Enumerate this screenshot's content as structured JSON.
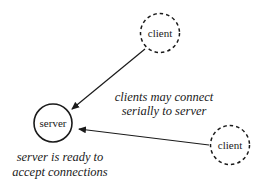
{
  "diagram": {
    "nodes": {
      "server": {
        "label": "server",
        "style": "solid",
        "cx": 53,
        "cy": 123,
        "r": 19
      },
      "client_top": {
        "label": "client",
        "style": "dashed",
        "cx": 160,
        "cy": 33,
        "r": 19.5
      },
      "client_right": {
        "label": "client",
        "style": "dashed",
        "cx": 230,
        "cy": 145,
        "r": 19.5
      }
    },
    "edges": [
      {
        "from": "client_top",
        "to": "server",
        "label": ""
      },
      {
        "from": "client_right",
        "to": "server",
        "label": ""
      }
    ],
    "annotations": {
      "clients_connect": {
        "line1": "clients may connect",
        "line2": "serially to server"
      },
      "server_ready": {
        "line1": "server is ready to",
        "line2": "accept connections"
      }
    },
    "colors": {
      "stroke": "#1a1a1a",
      "background": "#ffffff"
    }
  }
}
